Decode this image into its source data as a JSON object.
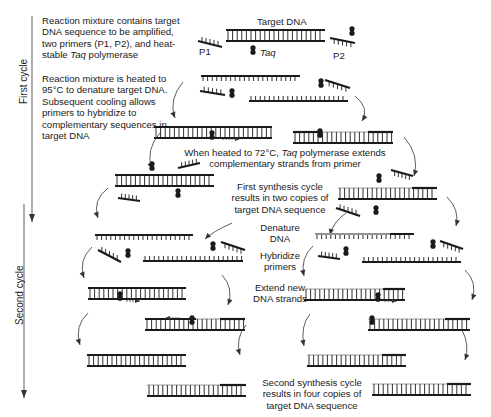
{
  "diagram": {
    "side_labels": {
      "first_cycle": "First cycle",
      "second_cycle": "Second cycle"
    },
    "steps": {
      "step1": {
        "pre": "Reaction mixture contains target DNA sequence to be amplified, two primers (P1, P2), and heat-stable ",
        "italic": "Taq",
        "post": " polymerase"
      },
      "step2": "Reaction mixture is heated to 95°C to denature target DNA. Subsequent cooling allows primers to hybridize to complementary sequences in target DNA",
      "step3": {
        "pre": "When heated to 72°C, ",
        "italic": "Taq",
        "post": " polymerase extends complementary strands from primer"
      },
      "step4": "First synthesis cycle results in two copies of target DNA sequence",
      "denature": "Denature DNA",
      "hybridize": "Hybridize primers",
      "extend": "Extend new DNA strands",
      "step_final": "Second synthesis cycle results in four copies of target DNA sequence"
    },
    "labels": {
      "target_dna": "Target DNA",
      "p1": "P1",
      "p2": "P2",
      "taq": "Taq"
    },
    "colors": {
      "strand": "#1a1a1a",
      "new_strand": "#bdbdbd",
      "arrow": "#333333"
    }
  }
}
